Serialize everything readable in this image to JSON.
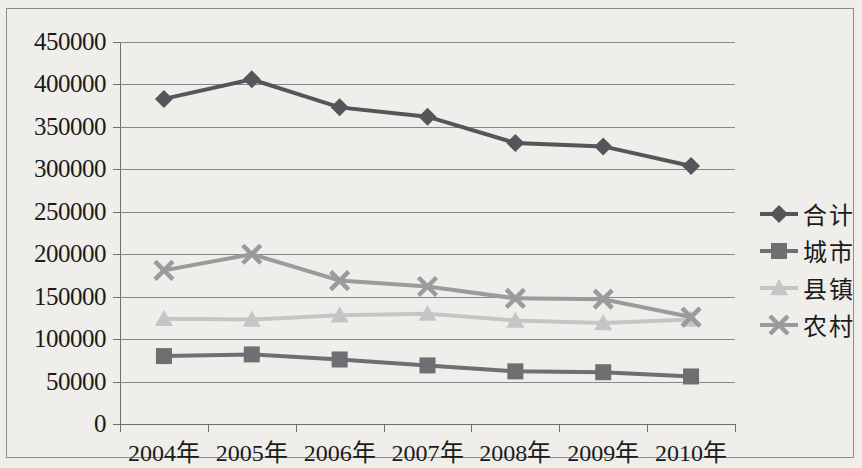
{
  "chart_data": {
    "type": "line",
    "title": "",
    "xlabel": "",
    "ylabel": "",
    "grid": true,
    "legend_position": "right",
    "categories": [
      "2004年",
      "2005年",
      "2006年",
      "2007年",
      "2008年",
      "2009年",
      "2010年"
    ],
    "ylim": [
      0,
      450000
    ],
    "ytick_labels": [
      "450000",
      "400000",
      "350000",
      "300000",
      "250000",
      "200000",
      "150000",
      "100000",
      "50000",
      "0"
    ],
    "yticks": [
      450000,
      400000,
      350000,
      300000,
      250000,
      200000,
      150000,
      100000,
      50000,
      0
    ],
    "series": [
      {
        "name": "合计",
        "marker": "diamond",
        "color": "#55555a",
        "values": [
          383000,
          406000,
          373000,
          362000,
          331000,
          327000,
          304000
        ]
      },
      {
        "name": "城市",
        "marker": "square",
        "color": "#6e6e73",
        "values": [
          80000,
          82000,
          76000,
          69000,
          62000,
          61000,
          56000
        ]
      },
      {
        "name": "县镇",
        "marker": "triangle",
        "color": "#c5c5c7",
        "values": [
          124000,
          123000,
          128000,
          130000,
          122000,
          119000,
          123000
        ]
      },
      {
        "name": "农村",
        "marker": "cross",
        "color": "#9b9b9e",
        "values": [
          181000,
          200000,
          169000,
          162000,
          148000,
          147000,
          126000
        ]
      }
    ]
  }
}
